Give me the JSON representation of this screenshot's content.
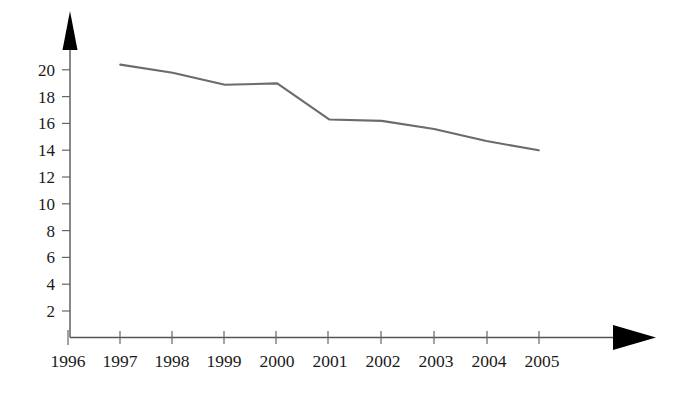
{
  "chart_data": {
    "type": "line",
    "title": "",
    "subtitle": "",
    "xlabel": "",
    "ylabel": "",
    "x": [
      1996,
      1997,
      1998,
      1999,
      2000,
      2001,
      2002,
      2003,
      2004,
      2005
    ],
    "categories": [
      "1996",
      "1997",
      "1998",
      "1999",
      "2000",
      "2001",
      "2002",
      "2003",
      "2004",
      "2005"
    ],
    "series": [
      {
        "name": "",
        "color": "#6b6b6b",
        "x": [
          1997,
          1998,
          1999,
          2000,
          2001,
          2002,
          2003,
          2004,
          2005
        ],
        "values": [
          20.4,
          19.8,
          18.9,
          19.0,
          16.3,
          16.2,
          15.6,
          14.7,
          14.0
        ]
      }
    ],
    "xtick_labels": [
      "1996",
      "1997",
      "1998",
      "1999",
      "2000",
      "2001",
      "2002",
      "2003",
      "2004",
      "2005"
    ],
    "ytick_labels": [
      "2",
      "4",
      "6",
      "8",
      "10",
      "12",
      "14",
      "16",
      "18",
      "20"
    ],
    "ytick_values": [
      2,
      4,
      6,
      8,
      10,
      12,
      14,
      16,
      18,
      20
    ],
    "xlim": [
      1996,
      2005
    ],
    "ylim": [
      0,
      21.5
    ],
    "grid": false,
    "legend": null,
    "annotations": [],
    "axis_style": {
      "x_axis_arrow": true,
      "y_axis_arrow": true,
      "axis_color": "#555555",
      "tick_color": "#666666",
      "arrow_color": "#000000"
    }
  },
  "labels": {
    "y_axis_name": "y-axis",
    "x_axis_name": "x-axis",
    "series_name": "declining-trend-line"
  }
}
